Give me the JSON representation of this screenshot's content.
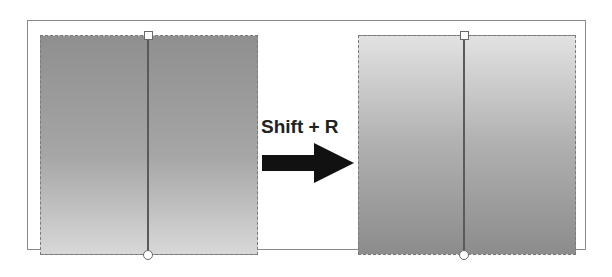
{
  "diagram": {
    "shortcut_label": "Shift + R",
    "before_panel": {
      "description": "Gradient dark at top, light at bottom",
      "gradient_top": "#8f8f8f",
      "gradient_bottom": "#d8d8d8",
      "handles": [
        "square-handle-top",
        "circle-handle-bottom"
      ]
    },
    "after_panel": {
      "description": "Gradient reversed: light at top, dark at bottom",
      "gradient_top": "#e2e2e2",
      "gradient_bottom": "#8c8c8c",
      "handles": [
        "square-handle-top",
        "circle-handle-bottom"
      ]
    },
    "arrow_icon": "right-arrow-icon",
    "colors": {
      "arrow": "#111111",
      "line": "#5a5a5a",
      "border": "#7a7a7a"
    }
  }
}
